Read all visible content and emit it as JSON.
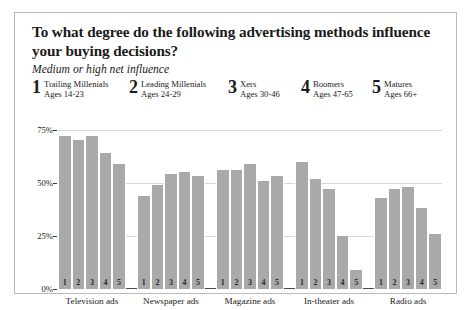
{
  "header": {
    "title": "To what degree do the following advertising methods influence your buying decisions?",
    "subtitle": "Medium or high net influence"
  },
  "legend": [
    {
      "num": "1",
      "name": "Trailing Millenials",
      "ages": "Ages 14-23"
    },
    {
      "num": "2",
      "name": "Leading Millenials",
      "ages": "Ages 24-29"
    },
    {
      "num": "3",
      "name": "Xers",
      "ages": "Ages 30-46"
    },
    {
      "num": "4",
      "name": "Boomers",
      "ages": "Ages 47-65"
    },
    {
      "num": "5",
      "name": "Matures",
      "ages": "Ages 66+"
    }
  ],
  "axis": {
    "ticks": [
      "75%",
      "50%",
      "25%",
      "0%"
    ]
  },
  "chart_data": {
    "type": "bar",
    "title": "To what degree do the following advertising methods influence your buying decisions?",
    "subtitle": "Medium or high net influence",
    "xlabel": "",
    "ylabel": "Medium or high net influence",
    "ylim": [
      0,
      80
    ],
    "yticks": [
      0,
      25,
      50,
      75
    ],
    "ytick_labels": [
      "0%",
      "25%",
      "50%",
      "75%"
    ],
    "grid": true,
    "legend_position": "top",
    "categories": [
      "Television ads",
      "Newspaper ads",
      "Magazine ads",
      "In-theater ads",
      "Radio ads"
    ],
    "series": [
      {
        "name": "Trailing Millenials",
        "num": "1",
        "ages": "Ages 14-23",
        "values": [
          72,
          44,
          56,
          60,
          43
        ]
      },
      {
        "name": "Leading Millenials",
        "num": "2",
        "ages": "Ages 24-29",
        "values": [
          70,
          49,
          56,
          52,
          47
        ]
      },
      {
        "name": "Xers",
        "num": "3",
        "ages": "Ages 30-46",
        "values": [
          72,
          54,
          59,
          47,
          48
        ]
      },
      {
        "name": "Boomers",
        "num": "4",
        "ages": "Ages 47-65",
        "values": [
          64,
          55,
          51,
          25,
          38
        ]
      },
      {
        "name": "Matures",
        "num": "5",
        "ages": "Ages 66+",
        "values": [
          59,
          53,
          53,
          9,
          26
        ]
      }
    ]
  }
}
